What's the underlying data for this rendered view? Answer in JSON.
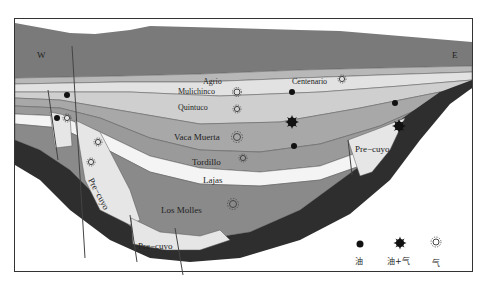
{
  "diagram": {
    "orientation": {
      "west": "W",
      "east": "E"
    },
    "formations": [
      {
        "id": "agrio",
        "label": "Agrio"
      },
      {
        "id": "centenario",
        "label": "Centenario"
      },
      {
        "id": "mulichinco",
        "label": "Mulichinco"
      },
      {
        "id": "quintuco",
        "label": "Quintuco"
      },
      {
        "id": "vaca-muerta",
        "label": "Vaca Muerta"
      },
      {
        "id": "tordillo",
        "label": "Tordillo"
      },
      {
        "id": "lajas",
        "label": "Lajas"
      },
      {
        "id": "los-molles",
        "label": "Los Molles"
      },
      {
        "id": "pre-cuyo-left",
        "label": "Pre−cuyo"
      },
      {
        "id": "pre-cuyo-bottom",
        "label": "Pre−cuyo"
      },
      {
        "id": "pre-cuyo-right",
        "label": "Pre−cuyo"
      }
    ],
    "legend": [
      {
        "symbol": "oil",
        "label": "油"
      },
      {
        "symbol": "oil-gas",
        "label": "油+气"
      },
      {
        "symbol": "gas",
        "label": "气"
      }
    ],
    "colors": {
      "overburden": "#7a7a7a",
      "agrio": "#b8b8b8",
      "mulichinco": "#dcdcdc",
      "quintuco": "#cfcfcf",
      "vaca_muerta": "#a8a8a8",
      "tordillo": "#9a9a9a",
      "lajas": "#f2f2f2",
      "los_molles": "#8a8a8a",
      "pre_cuyo": "#e4e4e4",
      "basement": "#2e2e2e",
      "frame": "#333333"
    }
  }
}
